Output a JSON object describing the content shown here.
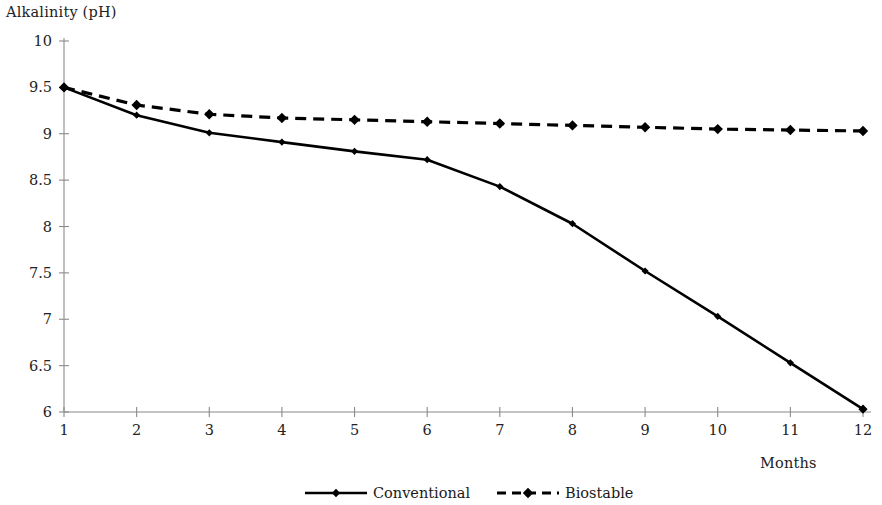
{
  "chart_data": {
    "type": "line",
    "title": "",
    "ylabel": "Alkalinity (pH)",
    "xlabel": "Months",
    "x": [
      1,
      2,
      3,
      4,
      5,
      6,
      7,
      8,
      9,
      10,
      11,
      12
    ],
    "xticklabels": [
      "1",
      "2",
      "3",
      "4",
      "5",
      "6",
      "7",
      "8",
      "9",
      "10",
      "11",
      "12"
    ],
    "yticklabels": [
      "6",
      "6.5",
      "7",
      "7.5",
      "8",
      "8.5",
      "9",
      "9.5",
      "10"
    ],
    "yticks": [
      6,
      6.5,
      7,
      7.5,
      8,
      8.5,
      9,
      9.5,
      10
    ],
    "xlim": [
      1,
      12
    ],
    "ylim": [
      6,
      10
    ],
    "grid": false,
    "legend_position": "bottom",
    "series": [
      {
        "name": "Conventional",
        "style": "solid",
        "marker": "diamond",
        "color": "#000000",
        "values": [
          9.5,
          9.2,
          9.01,
          8.91,
          8.81,
          8.72,
          8.43,
          8.03,
          7.52,
          7.03,
          6.53,
          6.03
        ]
      },
      {
        "name": "Biostable",
        "style": "dashed",
        "marker": "diamond",
        "color": "#000000",
        "values": [
          9.5,
          9.31,
          9.21,
          9.17,
          9.15,
          9.13,
          9.11,
          9.09,
          9.07,
          9.05,
          9.04,
          9.03
        ]
      }
    ]
  },
  "legend": {
    "items": [
      {
        "label": "Conventional",
        "style": "solid"
      },
      {
        "label": "Biostable",
        "style": "dashed"
      }
    ]
  }
}
